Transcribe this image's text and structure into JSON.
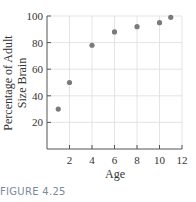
{
  "caption": "FIGURE 4.25",
  "chart_data": {
    "type": "scatter",
    "title": "",
    "xlabel": "Age",
    "ylabel": "Percentage of Adult Size Brain",
    "ylabel_lines": [
      "Percentage of Adult",
      "Size Brain"
    ],
    "xlim": [
      0,
      12
    ],
    "ylim": [
      0,
      100
    ],
    "xticks": [
      2,
      4,
      6,
      8,
      10,
      12
    ],
    "yticks": [
      20,
      40,
      60,
      80,
      100
    ],
    "grid": true,
    "points": [
      {
        "x": 1,
        "y": 30
      },
      {
        "x": 2,
        "y": 50
      },
      {
        "x": 4,
        "y": 78
      },
      {
        "x": 6,
        "y": 88
      },
      {
        "x": 8,
        "y": 92
      },
      {
        "x": 10,
        "y": 95
      },
      {
        "x": 11,
        "y": 99
      }
    ],
    "colors": {
      "point": "#7a7a7a",
      "axis": "#555555",
      "grid": "#dddddd"
    }
  }
}
